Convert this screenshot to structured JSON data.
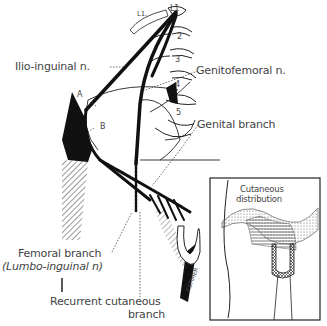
{
  "figure": {
    "labels": {
      "ilioinguinal": "Ilio-inguinal n.",
      "genitofemoral": "Genitofemoral n.",
      "genital_branch": "Genital branch",
      "femoral_branch": "Femoral branch",
      "lumbo_inguinal": "(Lumbo-inguinal n)",
      "recurrent_1": "Recurrent cutaneous",
      "recurrent_2": "branch",
      "point_a": "A",
      "point_b": "B",
      "l1_left": "L1.",
      "l1_right": "L1",
      "vert_2": "2",
      "vert_3": "3",
      "vert_4": "4",
      "vert_5": "5",
      "signature": "F.STIMER"
    },
    "inset": {
      "title_1": "Cutaneous",
      "title_2": "distribution"
    }
  }
}
